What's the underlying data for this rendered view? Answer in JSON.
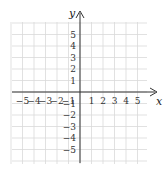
{
  "chart_data": {
    "type": "scatter",
    "title": "",
    "xlabel": "x",
    "ylabel": "y",
    "xlim": [
      -6,
      6
    ],
    "ylim": [
      -6,
      6
    ],
    "grid": true,
    "x_ticks": [
      -5,
      -4,
      -3,
      -2,
      -1,
      1,
      2,
      3,
      4,
      5
    ],
    "y_ticks": [
      5,
      4,
      3,
      2,
      1,
      -1,
      -2,
      -3,
      -4,
      -5
    ],
    "x_tick_labels": [
      "−5",
      "−4",
      "−3",
      "−2",
      "−1",
      "1",
      "2",
      "3",
      "4",
      "5"
    ],
    "y_tick_labels": [
      "5",
      "4",
      "3",
      "2",
      "1",
      "−1",
      "−2",
      "−3",
      "−4",
      "−5"
    ],
    "series": [],
    "colors": {
      "grid": "#d9d9d9",
      "axis": "#333333",
      "text": "#333333"
    }
  },
  "labels": {
    "x_axis": "x",
    "y_axis": "y"
  }
}
